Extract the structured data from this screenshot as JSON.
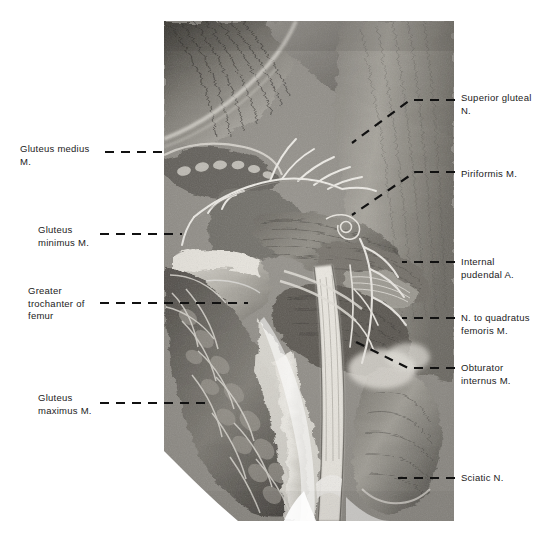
{
  "figure": {
    "caption": "",
    "plate": {
      "kind": "anatomical-photograph",
      "subject": "right gluteal region, deep dissection",
      "tone_dark": "#2d2d2d",
      "tone_mid": "#8a8a8a",
      "tone_light": "#e8e6e1",
      "highlight": "#f5f3ee",
      "background": "#ffffff"
    }
  },
  "labels": {
    "left": [
      {
        "id": "gluteus-medius",
        "text": "Gluteus medius\nM.",
        "x": 20,
        "y": 143,
        "leader": [
          [
            105,
            152
          ],
          [
            168,
            152
          ]
        ]
      },
      {
        "id": "gluteus-minimus",
        "text": "Gluteus\nminimus M.",
        "x": 38,
        "y": 224,
        "leader": [
          [
            100,
            234
          ],
          [
            182,
            234
          ]
        ]
      },
      {
        "id": "greater-trochanter",
        "text": "Greater\ntrochanter of\nfemur",
        "x": 28,
        "y": 285,
        "leader": [
          [
            100,
            303
          ],
          [
            248,
            303
          ]
        ]
      },
      {
        "id": "gluteus-maximus",
        "text": "Gluteus\nmaximus M.",
        "x": 38,
        "y": 392,
        "leader": [
          [
            100,
            403
          ],
          [
            205,
            403
          ]
        ]
      }
    ],
    "right": [
      {
        "id": "superior-gluteal-nerve",
        "text": "Superior gluteal\nN.",
        "x": 461,
        "y": 92,
        "leader": [
          [
            455,
            100
          ],
          [
            410,
            100
          ],
          [
            352,
            143
          ]
        ]
      },
      {
        "id": "piriformis",
        "text": "Piriformis M.",
        "x": 461,
        "y": 168,
        "leader": [
          [
            455,
            172
          ],
          [
            415,
            172
          ],
          [
            352,
            215
          ]
        ]
      },
      {
        "id": "internal-pudendal-artery",
        "text": "Internal\npudendal A.",
        "x": 461,
        "y": 256,
        "leader": [
          [
            455,
            262
          ],
          [
            402,
            262
          ]
        ]
      },
      {
        "id": "nerve-to-quadratus-femoris",
        "text": "N. to quadratus\nfemoris M.",
        "x": 461,
        "y": 312,
        "leader": [
          [
            455,
            318
          ],
          [
            402,
            318
          ]
        ]
      },
      {
        "id": "obturator-internus",
        "text": "Obturator\ninternus M.",
        "x": 461,
        "y": 362,
        "leader": [
          [
            455,
            368
          ],
          [
            408,
            368
          ],
          [
            352,
            340
          ]
        ]
      },
      {
        "id": "sciatic-nerve",
        "text": "Sciatic N.",
        "x": 461,
        "y": 472,
        "leader": [
          [
            455,
            478
          ],
          [
            398,
            478
          ]
        ]
      }
    ]
  },
  "leader_style": {
    "color": "#111111",
    "width": 2.2,
    "dash": "9 7"
  }
}
